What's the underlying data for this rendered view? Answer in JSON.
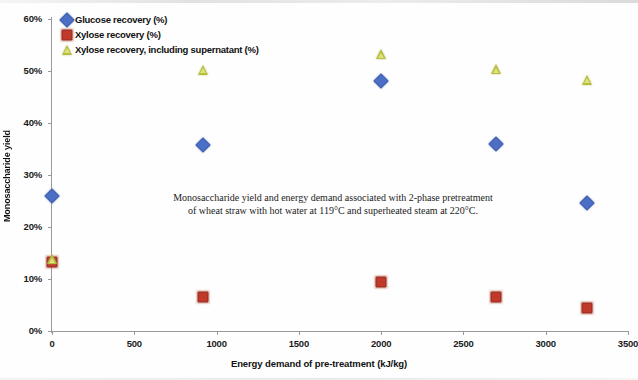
{
  "chart_data": {
    "type": "scatter",
    "title": "",
    "xlabel": "Energy demand of pre-treatment (kJ/kg)",
    "ylabel": "Monosaccharide yield",
    "xlim": [
      0,
      3500
    ],
    "ylim": [
      0,
      60
    ],
    "x_ticks": [
      0,
      500,
      1000,
      1500,
      2000,
      2500,
      3000,
      3500
    ],
    "x_tick_labels": [
      "0",
      "500",
      "1000",
      "1500",
      "2000",
      "2500",
      "3000",
      "3500"
    ],
    "y_ticks": [
      0,
      10,
      20,
      30,
      40,
      50,
      60
    ],
    "y_tick_labels": [
      "0%",
      "10%",
      "20%",
      "30%",
      "40%",
      "50%",
      "60%"
    ],
    "grid": false,
    "legend_position": "top-left",
    "series": [
      {
        "name": "Glucose recovery (%)",
        "marker": "diamond",
        "color": "#4a6fc4",
        "points": [
          {
            "x": 0,
            "y": 26.0
          },
          {
            "x": 920,
            "y": 35.8
          },
          {
            "x": 2000,
            "y": 48.0
          },
          {
            "x": 2700,
            "y": 36.0
          },
          {
            "x": 3250,
            "y": 24.7
          }
        ]
      },
      {
        "name": "Xylose recovery (%)",
        "marker": "square",
        "color": "#c0392b",
        "points": [
          {
            "x": 0,
            "y": 13.3
          },
          {
            "x": 920,
            "y": 6.5
          },
          {
            "x": 2000,
            "y": 9.5
          },
          {
            "x": 2700,
            "y": 6.5
          },
          {
            "x": 3250,
            "y": 4.5
          }
        ]
      },
      {
        "name": "Xylose recovery, including supernatant (%)",
        "marker": "triangle",
        "color": "#b6bf3d",
        "points": [
          {
            "x": 0,
            "y": 13.8
          },
          {
            "x": 920,
            "y": 50.2
          },
          {
            "x": 2000,
            "y": 53.2
          },
          {
            "x": 2700,
            "y": 50.3
          },
          {
            "x": 3250,
            "y": 48.3
          }
        ]
      }
    ],
    "annotation": {
      "line1": "Monosaccharide yield and energy demand associated with 2-phase pretreatment",
      "line2": "of wheat straw with hot water at 119°C and superheated steam at 220°C."
    }
  }
}
